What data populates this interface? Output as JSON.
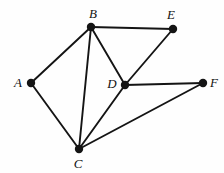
{
  "figure": {
    "name": "undirected-graph-diagram",
    "background_color": "#fefefe",
    "edge_color": "#141414",
    "vertex_color": "#141414",
    "label_color": "#111111",
    "width": 224,
    "height": 173
  },
  "chart_data": {
    "type": "diagram",
    "title": "",
    "graph_type": "undirected graph",
    "vertex_count": 6,
    "edge_count": 9,
    "vertices": [
      {
        "id": "A",
        "label": "A",
        "x": 31,
        "y": 83,
        "label_x": 18,
        "label_y": 82,
        "degree": 2
      },
      {
        "id": "B",
        "label": "B",
        "x": 91,
        "y": 27,
        "label_x": 93,
        "label_y": 13,
        "degree": 4
      },
      {
        "id": "C",
        "label": "C",
        "x": 79,
        "y": 149,
        "label_x": 78,
        "label_y": 163,
        "degree": 4
      },
      {
        "id": "D",
        "label": "D",
        "x": 125,
        "y": 85,
        "label_x": 112,
        "label_y": 83,
        "degree": 4
      },
      {
        "id": "E",
        "label": "E",
        "x": 173,
        "y": 29,
        "label_x": 171,
        "label_y": 14,
        "degree": 2
      },
      {
        "id": "F",
        "label": "F",
        "x": 203,
        "y": 83,
        "label_x": 214,
        "label_y": 82,
        "degree": 2
      }
    ],
    "edges": [
      {
        "from": "A",
        "to": "B"
      },
      {
        "from": "A",
        "to": "C"
      },
      {
        "from": "B",
        "to": "C"
      },
      {
        "from": "B",
        "to": "D"
      },
      {
        "from": "B",
        "to": "E"
      },
      {
        "from": "C",
        "to": "D"
      },
      {
        "from": "C",
        "to": "F"
      },
      {
        "from": "D",
        "to": "E"
      },
      {
        "from": "D",
        "to": "F"
      }
    ],
    "vertex_radius": 4.2,
    "edge_width": 1.9
  }
}
